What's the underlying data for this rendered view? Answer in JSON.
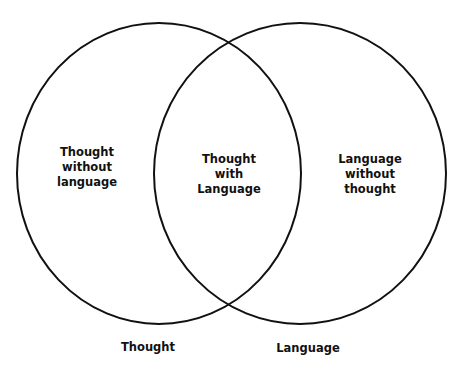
{
  "diagram": {
    "type": "venn",
    "colors": {
      "stroke": "#111111",
      "background": "#ffffff",
      "text": "#111111"
    },
    "sets": [
      {
        "id": "thought",
        "label": "Thought"
      },
      {
        "id": "language",
        "label": "Language"
      }
    ],
    "regions": {
      "left_only": {
        "lines": [
          "Thought",
          "without",
          "language"
        ]
      },
      "intersection": {
        "lines": [
          "Thought",
          "with",
          "Language"
        ]
      },
      "right_only": {
        "lines": [
          "Language",
          "without",
          "thought"
        ]
      }
    }
  }
}
